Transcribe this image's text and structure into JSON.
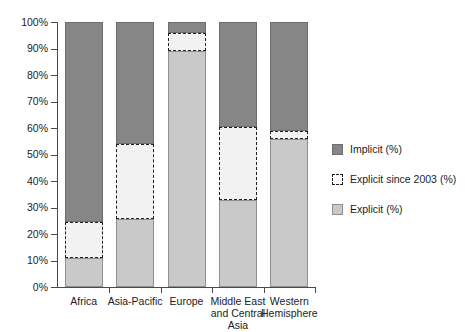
{
  "chart_data": {
    "type": "bar",
    "subtype": "stacked-bar-100-percent",
    "title": "",
    "subtitle": "",
    "xlabel": "",
    "ylabel": "",
    "ylim": [
      0,
      100
    ],
    "grid": false,
    "legend_position": "right",
    "categories": [
      "Africa",
      "Asia-Pacific",
      "Europe",
      "Middle East and Central Asia",
      "Western Hemisphere"
    ],
    "category_label_lines": [
      [
        "Africa"
      ],
      [
        "Asia-Pacific"
      ],
      [
        "Europe"
      ],
      [
        "Middle East",
        "and Central",
        "Asia"
      ],
      [
        "Western",
        "Hemisphere"
      ]
    ],
    "ytick_labels": [
      "0%",
      "10%",
      "20%",
      "30%",
      "40%",
      "50%",
      "60%",
      "70%",
      "80%",
      "90%",
      "100%"
    ],
    "ytick_values": [
      0,
      10,
      20,
      30,
      40,
      50,
      60,
      70,
      80,
      90,
      100
    ],
    "series": [
      {
        "name": "Explicit (%)",
        "color": "#c9c9c9",
        "values": [
          11,
          25.5,
          89,
          33,
          56
        ]
      },
      {
        "name": "Explicit since 2003 (%)",
        "color": "#f2f2f2",
        "values": [
          13.5,
          28.5,
          7,
          27.5,
          3
        ]
      },
      {
        "name": "Implicit (%)",
        "color": "#868686",
        "values": [
          75.5,
          46,
          4,
          39.5,
          41
        ]
      }
    ],
    "cumulative_tops": {
      "explicit": [
        11,
        25.5,
        89,
        33,
        56
      ],
      "explicit_since_2003": [
        24.5,
        54,
        96,
        60.5,
        59
      ],
      "implicit": [
        100,
        100,
        100,
        100,
        100
      ]
    },
    "legend": [
      {
        "label": "Implicit (%)",
        "swatch": "implicit",
        "color": "#868686"
      },
      {
        "label": "Explicit since 2003 (%)",
        "swatch": "explicit-2003",
        "color": "#ffffff"
      },
      {
        "label": "Explicit (%)",
        "swatch": "explicit",
        "color": "#c9c9c9"
      }
    ]
  },
  "colors": {
    "implicit": "#868686",
    "explicit_since_2003": "#f2f2f2",
    "explicit": "#c9c9c9",
    "axis": "#4a4a4a",
    "text": "#222222",
    "background": "#ffffff"
  }
}
